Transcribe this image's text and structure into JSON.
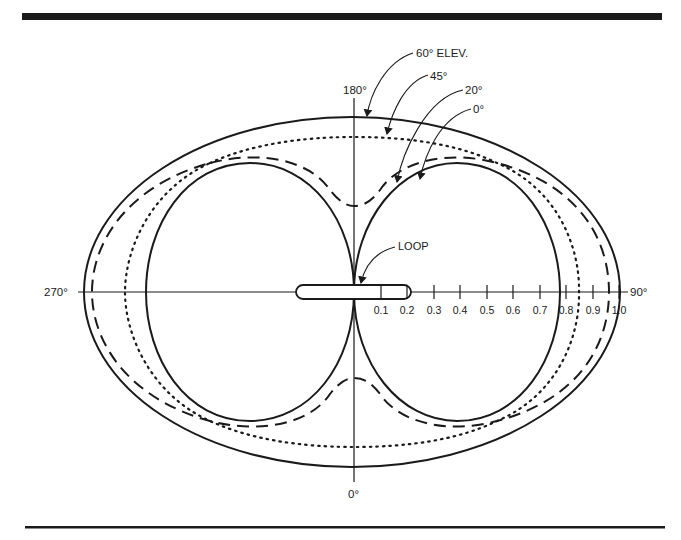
{
  "figure": {
    "type": "polar-radiation-pattern"
  },
  "axis_labels": {
    "top": "180°",
    "bottom": "0°",
    "left": "270°",
    "right": "90°"
  },
  "scale": {
    "ticks": [
      "0.1",
      "0.2",
      "0.3",
      "0.4",
      "0.5",
      "0.6",
      "0.7",
      "0.8",
      "0.9",
      "1.0"
    ]
  },
  "annotations": {
    "loop": "LOOP",
    "elev_60": "60° ELEV.",
    "elev_45": "45°",
    "elev_20": "20°",
    "elev_0": "0°"
  },
  "curves": [
    {
      "name": "60° elevation",
      "style": "solid (outer ellipse)"
    },
    {
      "name": "45° elevation",
      "style": "dotted"
    },
    {
      "name": "20° elevation",
      "style": "dashed"
    },
    {
      "name": "0° elevation",
      "style": "solid (figure-eight lobes)"
    }
  ],
  "colors": {
    "ink": "#1a1a1a",
    "background": "#ffffff"
  }
}
